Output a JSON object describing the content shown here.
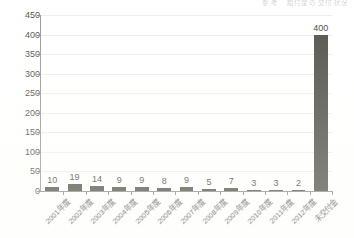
{
  "header": {
    "faint_texts": [
      "参 考",
      "給付金 の 交付 状況"
    ]
  },
  "chart_data": {
    "type": "bar",
    "title": "",
    "xlabel": "",
    "ylabel": "",
    "ylim": [
      0,
      450
    ],
    "yticks": [
      450,
      400,
      350,
      300,
      250,
      200,
      150,
      100,
      50,
      0
    ],
    "grid": true,
    "legend": "none",
    "bar_color": "#55554f",
    "categories": [
      "2001年度",
      "2002年度",
      "2003年度",
      "2004年度",
      "2005年度",
      "2006年度",
      "2007年度",
      "2008年度",
      "2009年度",
      "2010年度",
      "2011年度",
      "2012年度",
      "未交付金"
    ],
    "values": [
      10,
      19,
      14,
      9,
      9,
      8,
      9,
      5,
      7,
      3,
      3,
      2,
      400
    ],
    "data_labels": [
      "10",
      "19",
      "14",
      "9",
      "9",
      "8",
      "9",
      "5",
      "7",
      "3",
      "3",
      "2",
      "400"
    ]
  }
}
